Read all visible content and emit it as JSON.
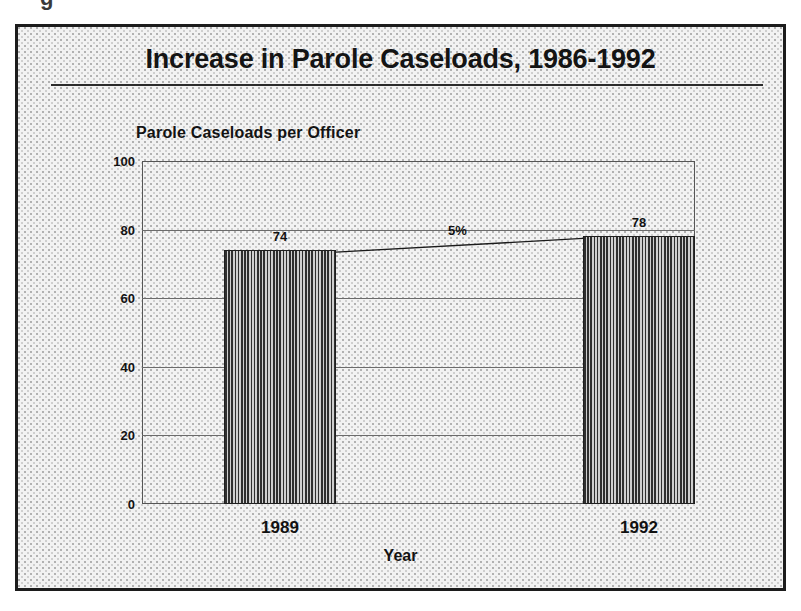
{
  "page": {
    "top_fragment_text": "g"
  },
  "figure": {
    "title": "Increase in Parole Caseloads, 1986-1992",
    "y_axis_caption": "Parole Caseloads per Officer",
    "x_axis_title": "Year"
  },
  "chart_data": {
    "type": "bar",
    "title": "Increase in Parole Caseloads, 1986-1992",
    "subtitle": "Parole Caseloads per Officer",
    "xlabel": "Year",
    "ylabel": "Parole Caseloads per Officer",
    "categories": [
      "1989",
      "1992"
    ],
    "values": [
      74,
      78
    ],
    "value_labels": [
      "74",
      "78"
    ],
    "ylim": [
      0,
      100
    ],
    "yticks": [
      0,
      20,
      40,
      60,
      80,
      100
    ],
    "ytick_labels": [
      "0",
      "20",
      "40",
      "60",
      "80",
      "100"
    ],
    "grid": "horizontal",
    "legend": "none",
    "annotations": [
      {
        "text": "5%",
        "meaning": "percent increase from 1989 to 1992",
        "from_category": "1989",
        "to_category": "1992"
      }
    ],
    "colors": {
      "bar_fill": "#2f2f2f",
      "bar_edge": "#1f1f1f",
      "background": "#f2f2f2",
      "grid": "#6b6b6b",
      "text": "#111111"
    }
  }
}
